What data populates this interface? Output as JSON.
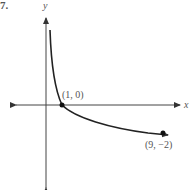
{
  "figure": {
    "number_label": "7.",
    "axis_labels": {
      "x": "x",
      "y": "y"
    },
    "curve": "logarithmic decreasing",
    "points": [
      {
        "label": "(1, 0)",
        "x": 1,
        "y": 0
      },
      {
        "label": "(9, −2)",
        "x": 9,
        "y": -2
      }
    ],
    "colors": {
      "axis": "#444444",
      "curve": "#222222",
      "text": "#555555"
    }
  }
}
